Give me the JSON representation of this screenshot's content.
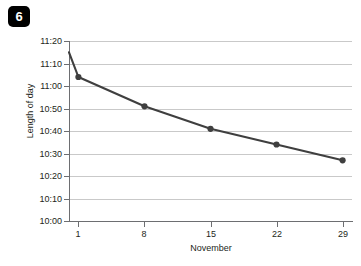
{
  "badge": {
    "number": "6"
  },
  "chart_data": {
    "type": "line",
    "title": "",
    "xlabel": "November",
    "ylabel": "Length of day",
    "grid": true,
    "legend": null,
    "x": [
      1,
      8,
      15,
      22,
      29
    ],
    "categories": [
      "1",
      "8",
      "15",
      "22",
      "29"
    ],
    "values": [
      "11:04",
      "10:51",
      "10:41",
      "10:34",
      "10:27"
    ],
    "values_minutes": [
      664,
      651,
      641,
      634,
      627
    ],
    "series": [
      {
        "name": "Length of day",
        "points": [
          {
            "x": 1,
            "label": "11:04",
            "minutes": 664
          },
          {
            "x": 8,
            "label": "10:51",
            "minutes": 651
          },
          {
            "x": 15,
            "label": "10:41",
            "minutes": 641
          },
          {
            "x": 22,
            "label": "10:34",
            "minutes": 634
          },
          {
            "x": 29,
            "label": "10:27",
            "minutes": 627
          }
        ]
      }
    ],
    "line_start": {
      "x": 0,
      "label": "11:15",
      "minutes": 675
    },
    "ylim": [
      "10:00",
      "11:20"
    ],
    "ylim_minutes": [
      600,
      680
    ],
    "y_ticks": [
      "11:20",
      "11:10",
      "11:00",
      "10:50",
      "10:40",
      "10:30",
      "10:20",
      "10:10",
      "10:00"
    ],
    "y_ticks_minutes": [
      680,
      670,
      660,
      650,
      640,
      630,
      620,
      610,
      600
    ],
    "x_ticks": [
      "1",
      "8",
      "15",
      "22",
      "29"
    ],
    "xlim": [
      0,
      30
    ],
    "colors": {
      "line": "#3f3f3f",
      "marker": "#3f3f3f",
      "grid": "#c9c9c9",
      "axis": "#6d6e71",
      "text": "#231f20",
      "badge_bg": "#000000",
      "badge_fg": "#ffffff"
    }
  }
}
